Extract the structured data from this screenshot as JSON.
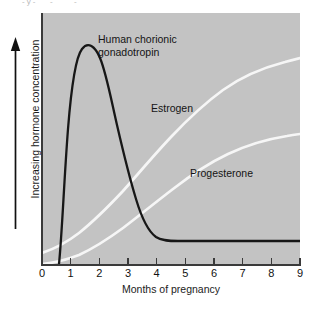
{
  "figure": {
    "title_strip_fragments": [
      "-y-",
      "-",
      "-"
    ],
    "background_color": "#ffffff",
    "plot_background_color": "#c3c3c3",
    "axis_color": "#3a3a3a"
  },
  "axes": {
    "y_label": "Increasing hormone concentration",
    "y_arrow_icon": "up-arrow-icon",
    "x_label": "Months of pregnancy",
    "x_ticks": [
      "0",
      "1",
      "2",
      "3",
      "4",
      "5",
      "6",
      "7",
      "8",
      "9"
    ]
  },
  "series_labels": {
    "hcg": "Human chorionic\ngonadotropin",
    "estrogen": "Estrogen",
    "progesterone": "Progesterone"
  },
  "chart_data": {
    "type": "line",
    "title": "",
    "subtitle": "",
    "xlabel": "Months of pregnancy",
    "ylabel": "Increasing hormone concentration",
    "xlim": [
      0,
      9
    ],
    "ylim": [
      0,
      100
    ],
    "grid": false,
    "legend": "inline-annotations",
    "x_ticks": [
      0,
      1,
      2,
      3,
      4,
      5,
      6,
      7,
      8,
      9
    ],
    "y_ticks": [],
    "annotations": [
      {
        "text": "Human chorionic gonadotropin",
        "x": 2.0,
        "y": 88
      },
      {
        "text": "Estrogen",
        "x": 3.9,
        "y": 63
      },
      {
        "text": "Progesterone",
        "x": 5.2,
        "y": 37
      }
    ],
    "series": [
      {
        "name": "Human chorionic gonadotropin",
        "color": "#1a1a1a",
        "style": "solid",
        "width": 2.2,
        "x": [
          0.65,
          0.8,
          0.95,
          1.1,
          1.25,
          1.35,
          1.5,
          1.7,
          1.9,
          2.1,
          2.35,
          2.6,
          2.9,
          3.2,
          3.5,
          3.8,
          4.1,
          4.35,
          4.55,
          5.0,
          6.0,
          7.0,
          8.0,
          9.0
        ],
        "y": [
          0,
          16,
          52,
          82,
          94,
          95,
          92,
          84,
          74,
          65,
          55,
          46,
          36,
          27,
          20,
          15,
          11,
          9.5,
          9,
          9,
          9,
          9,
          9,
          9
        ]
      },
      {
        "name": "Estrogen",
        "color": "#f4f4f4",
        "style": "solid",
        "width": 2.6,
        "x": [
          0,
          0.5,
          1.0,
          1.5,
          2.0,
          2.5,
          3.0,
          3.5,
          4.0,
          4.5,
          5.0,
          5.5,
          6.0,
          6.5,
          7.0,
          7.5,
          8.0,
          8.5,
          9.0
        ],
        "y": [
          4,
          6,
          9,
          13,
          18,
          23,
          29,
          35,
          42,
          49,
          55,
          61,
          66,
          70,
          73,
          75,
          76.5,
          77.5,
          78
        ]
      },
      {
        "name": "Progesterone",
        "color": "#f4f4f4",
        "style": "solid",
        "width": 2.6,
        "x": [
          0,
          0.5,
          1.0,
          1.5,
          2.0,
          2.5,
          3.0,
          3.5,
          4.0,
          4.5,
          5.0,
          5.5,
          6.0,
          6.5,
          7.0,
          7.5,
          8.0,
          8.5,
          9.0
        ],
        "y": [
          0,
          1,
          3,
          5.5,
          9,
          13,
          17,
          22,
          27,
          32,
          37,
          42,
          46,
          50,
          53,
          55,
          56.5,
          57.5,
          58
        ]
      }
    ]
  }
}
